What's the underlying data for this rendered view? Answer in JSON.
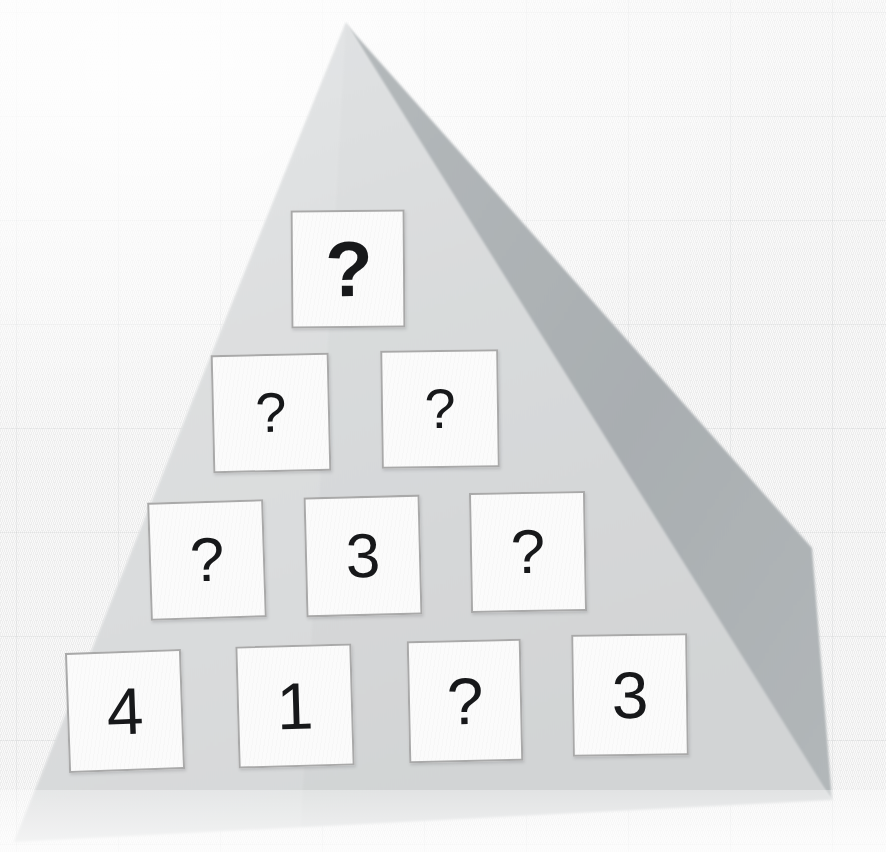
{
  "scene": {
    "title": "Number pyramid puzzle on grid paper",
    "background_color": "#f2f2f2",
    "sheet_color": "#d9dbdc",
    "sheet_edge_color": "#cfd2d3",
    "shadow_color": "#aab0b2",
    "card_face_color": "#fbfbfb",
    "card_border_color": "#a9a9a9",
    "glyph_color": "#17181a"
  },
  "pyramid": {
    "description": "Four-row number pyramid of square cards; unknown cells show a question mark.",
    "unknown_symbol": "?",
    "rows": [
      {
        "index": 1,
        "cards": [
          {
            "value": "?",
            "known": false,
            "x": 291,
            "y": 210,
            "w": 114,
            "h": 118,
            "rotate": -0.4
          }
        ]
      },
      {
        "index": 2,
        "cards": [
          {
            "value": "?",
            "known": false,
            "x": 212,
            "y": 354,
            "w": 118,
            "h": 118,
            "rotate": -1.3
          },
          {
            "value": "?",
            "known": false,
            "x": 381,
            "y": 350,
            "w": 118,
            "h": 118,
            "rotate": -0.8
          }
        ]
      },
      {
        "index": 3,
        "cards": [
          {
            "value": "?",
            "known": false,
            "x": 149,
            "y": 501,
            "w": 116,
            "h": 118,
            "rotate": -1.8
          },
          {
            "value": "3",
            "known": true,
            "x": 305,
            "y": 496,
            "w": 116,
            "h": 120,
            "rotate": -1.4
          },
          {
            "value": "?",
            "known": false,
            "x": 470,
            "y": 492,
            "w": 116,
            "h": 120,
            "rotate": -1.0
          }
        ]
      },
      {
        "index": 4,
        "cards": [
          {
            "value": "4",
            "known": true,
            "x": 67,
            "y": 651,
            "w": 116,
            "h": 120,
            "rotate": -2.0
          },
          {
            "value": "1",
            "known": true,
            "x": 237,
            "y": 645,
            "w": 116,
            "h": 122,
            "rotate": -1.6
          },
          {
            "value": "?",
            "known": false,
            "x": 408,
            "y": 640,
            "w": 114,
            "h": 122,
            "rotate": -1.2
          },
          {
            "value": "3",
            "known": true,
            "x": 572,
            "y": 634,
            "w": 116,
            "h": 122,
            "rotate": -0.8
          }
        ]
      }
    ]
  }
}
